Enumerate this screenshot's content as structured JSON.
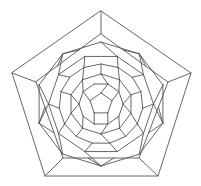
{
  "diagram": {
    "type": "schlegel-diagram",
    "stroke_color": "#555555",
    "background": "#ffffff",
    "center": [
      101,
      104
    ],
    "outer_pentagon": [
      [
        101,
        11
      ],
      [
        191,
        73
      ],
      [
        158,
        176
      ],
      [
        45,
        176
      ],
      [
        12,
        73
      ]
    ],
    "second_pentagon": [
      [
        101,
        34
      ],
      [
        168,
        82
      ],
      [
        139,
        158
      ],
      [
        63,
        158
      ],
      [
        36,
        82
      ]
    ],
    "rings": [
      {
        "r": 62,
        "n": 10,
        "offset": -90
      },
      {
        "r": 50,
        "n": 10,
        "offset": -72
      },
      {
        "r": 40,
        "n": 15,
        "offset": -90
      },
      {
        "r": 30,
        "n": 10,
        "offset": -90
      },
      {
        "r": 21,
        "n": 10,
        "offset": -72
      },
      {
        "r": 11,
        "n": 5,
        "offset": -90
      }
    ]
  }
}
